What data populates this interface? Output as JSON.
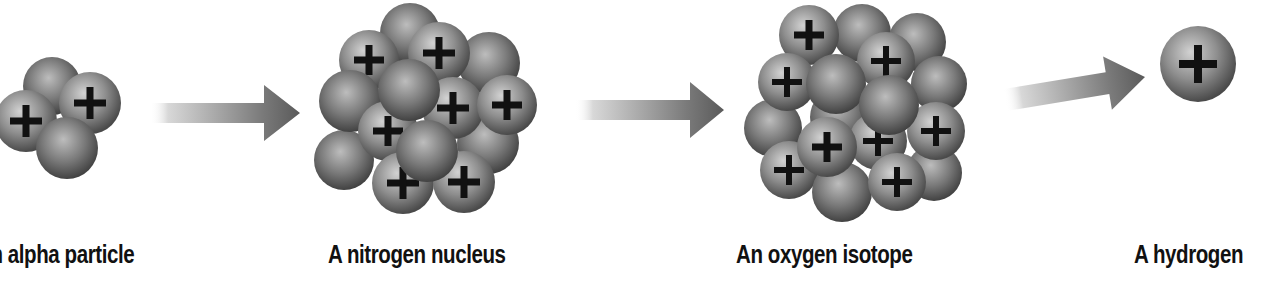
{
  "diagram": {
    "labels": [
      {
        "id": "alpha",
        "text": "An alpha particle",
        "x": -24
      },
      {
        "id": "nitrogen",
        "text": "A nitrogen nucleus",
        "x": 328
      },
      {
        "id": "oxygen",
        "text": "An oxygen isotope",
        "x": 736
      },
      {
        "id": "hydrogen",
        "text": "A hydrogen",
        "x": 1134
      }
    ],
    "colors": {
      "background": "#ffffff",
      "sphere_light": "#d2d2d2",
      "sphere_mid": "#8e8e8e",
      "sphere_dark": "#4a4a4a",
      "plus_sign": "#111111",
      "arrow_dark": "#5a5a5a",
      "arrow_light": "#ffffff",
      "label_text": "#111111"
    },
    "arrows": [
      {
        "id": "arrow-1",
        "x1": 150,
        "y1": 113,
        "x2": 300,
        "y2": 113,
        "shaft": 20,
        "head_w": 56,
        "head_l": 36
      },
      {
        "id": "arrow-2",
        "x1": 575,
        "y1": 110,
        "x2": 724,
        "y2": 110,
        "shaft": 20,
        "head_w": 56,
        "head_l": 34
      },
      {
        "id": "arrow-3",
        "x1": 1005,
        "y1": 100,
        "x2": 1145,
        "y2": 77,
        "shaft": 22,
        "head_w": 54,
        "head_l": 38
      }
    ],
    "particles": {
      "alpha": {
        "name": "alpha-particle",
        "protons": 2,
        "neutrons": 2,
        "spheres": [
          {
            "cx": 52,
            "cy": 86,
            "r": 29,
            "plus": false
          },
          {
            "cx": 26,
            "cy": 121,
            "r": 31,
            "plus": true
          },
          {
            "cx": 90,
            "cy": 103,
            "r": 31,
            "plus": true
          },
          {
            "cx": 67,
            "cy": 148,
            "r": 31,
            "plus": false
          }
        ]
      },
      "nitrogen": {
        "name": "nitrogen-nucleus",
        "protons": 7,
        "neutrons": 7,
        "spheres": [
          {
            "cx": 410,
            "cy": 33,
            "r": 30,
            "plus": false
          },
          {
            "cx": 489,
            "cy": 63,
            "r": 31,
            "plus": false
          },
          {
            "cx": 344,
            "cy": 160,
            "r": 30,
            "plus": false
          },
          {
            "cx": 488,
            "cy": 143,
            "r": 31,
            "plus": false
          },
          {
            "cx": 369,
            "cy": 60,
            "r": 30,
            "plus": true
          },
          {
            "cx": 439,
            "cy": 53,
            "r": 31,
            "plus": true
          },
          {
            "cx": 350,
            "cy": 101,
            "r": 31,
            "plus": false
          },
          {
            "cx": 388,
            "cy": 131,
            "r": 30,
            "plus": true
          },
          {
            "cx": 453,
            "cy": 108,
            "r": 31,
            "plus": true
          },
          {
            "cx": 507,
            "cy": 105,
            "r": 30,
            "plus": true
          },
          {
            "cx": 409,
            "cy": 90,
            "r": 31,
            "plus": false
          },
          {
            "cx": 403,
            "cy": 183,
            "r": 31,
            "plus": true
          },
          {
            "cx": 464,
            "cy": 182,
            "r": 31,
            "plus": true
          },
          {
            "cx": 427,
            "cy": 151,
            "r": 31,
            "plus": false
          }
        ]
      },
      "oxygen": {
        "name": "oxygen-isotope",
        "protons": 8,
        "neutrons": 9,
        "spheres": [
          {
            "cx": 862,
            "cy": 33,
            "r": 29,
            "plus": false
          },
          {
            "cx": 917,
            "cy": 42,
            "r": 29,
            "plus": false
          },
          {
            "cx": 939,
            "cy": 84,
            "r": 28,
            "plus": false
          },
          {
            "cx": 773,
            "cy": 128,
            "r": 29,
            "plus": false
          },
          {
            "cx": 839,
            "cy": 117,
            "r": 29,
            "plus": false
          },
          {
            "cx": 934,
            "cy": 173,
            "r": 28,
            "plus": false
          },
          {
            "cx": 809,
            "cy": 35,
            "r": 30,
            "plus": true
          },
          {
            "cx": 787,
            "cy": 82,
            "r": 29,
            "plus": true
          },
          {
            "cx": 886,
            "cy": 61,
            "r": 29,
            "plus": true
          },
          {
            "cx": 836,
            "cy": 84,
            "r": 30,
            "plus": false
          },
          {
            "cx": 936,
            "cy": 131,
            "r": 29,
            "plus": true
          },
          {
            "cx": 878,
            "cy": 141,
            "r": 29,
            "plus": true
          },
          {
            "cx": 789,
            "cy": 170,
            "r": 29,
            "plus": true
          },
          {
            "cx": 842,
            "cy": 192,
            "r": 30,
            "plus": false
          },
          {
            "cx": 897,
            "cy": 182,
            "r": 29,
            "plus": true
          },
          {
            "cx": 889,
            "cy": 105,
            "r": 30,
            "plus": false
          },
          {
            "cx": 827,
            "cy": 147,
            "r": 30,
            "plus": true
          }
        ]
      },
      "hydrogen": {
        "name": "hydrogen-nucleus",
        "protons": 1,
        "neutrons": 0,
        "spheres": [
          {
            "cx": 1198,
            "cy": 64,
            "r": 38,
            "plus": true
          }
        ]
      }
    }
  }
}
